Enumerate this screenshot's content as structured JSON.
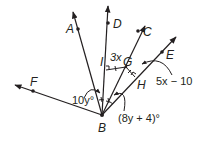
{
  "diagram": {
    "type": "geometry-angle-bisectors",
    "vertex": {
      "label": "B"
    },
    "points": [
      {
        "label": "A"
      },
      {
        "label": "D"
      },
      {
        "label": "C"
      },
      {
        "label": "E"
      },
      {
        "label": "F"
      },
      {
        "label": "I"
      },
      {
        "label": "G"
      },
      {
        "label": "H"
      }
    ],
    "expressions": {
      "ig_length": "3x",
      "gh_length": "5x − 10",
      "angle_abd": "10y°",
      "angle_dbc_part": "(8y + 4)°"
    },
    "colors": {
      "stroke": "#231f20",
      "background": "#ffffff"
    }
  }
}
